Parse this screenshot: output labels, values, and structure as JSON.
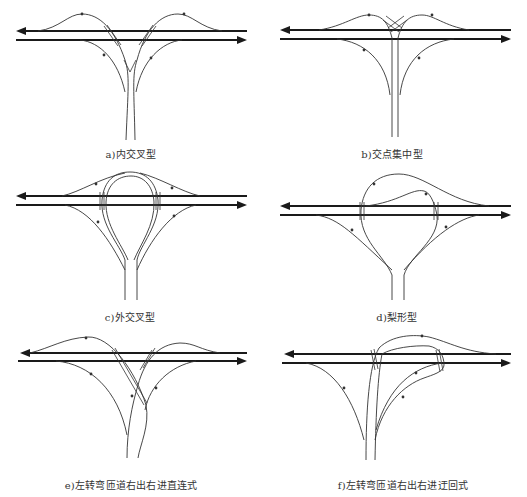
{
  "figure": {
    "panels": [
      {
        "id": "a",
        "caption": "a)内交叉型",
        "name": "inner-crossing-type"
      },
      {
        "id": "b",
        "caption": "b)交点集中型",
        "name": "concentrated-intersection-type"
      },
      {
        "id": "c",
        "caption": "c)外交叉型",
        "name": "outer-crossing-type"
      },
      {
        "id": "d",
        "caption": "d)梨形型",
        "name": "pear-shape-type"
      },
      {
        "id": "e",
        "caption": "e)左转弯匝道右出右进直连式",
        "name": "left-turn-ramp-right-exit-right-entry-direct"
      },
      {
        "id": "f",
        "caption": "f)左转弯匝道右出右进迂回式",
        "name": "left-turn-ramp-right-exit-right-entry-loop"
      }
    ],
    "colors": {
      "line": "#1a1a1a",
      "ramp": "#333333",
      "background": "#ffffff"
    }
  }
}
